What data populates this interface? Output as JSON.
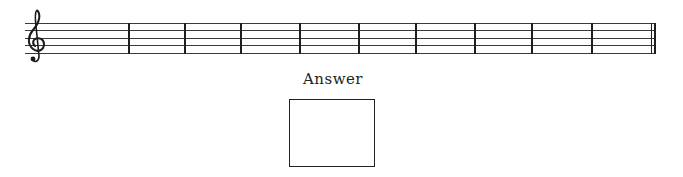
{
  "staff": {
    "clef": "treble-clef",
    "line_count": 5,
    "measure_count": 10,
    "barline_x": [
      128,
      185,
      241,
      300,
      359,
      416,
      475,
      532,
      592
    ],
    "final_barline": "double"
  },
  "answer": {
    "label": "Answer",
    "value": ""
  },
  "colors": {
    "ink": "#222222",
    "background": "#ffffff"
  }
}
